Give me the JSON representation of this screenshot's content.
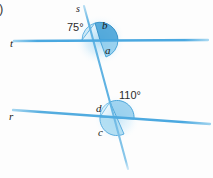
{
  "figure": {
    "kind": "geometry-diagram",
    "background_color": "#fdfdfd",
    "list_marker": ")",
    "line_color": "#4aa8e0",
    "line_color_light": "#8fcdee",
    "arc_fill": "#b9e0f5",
    "arc_fill_strong": "#6cc0ea",
    "arc_stroke": "#3f9fd6",
    "glow_color": "#bfe3f7",
    "label_color": "#1a1a1a"
  },
  "lines": [
    {
      "id": "line-t",
      "label": "t",
      "label_x": 10,
      "label_y": 45,
      "x1": 14,
      "y1": 41,
      "x2": 208,
      "y2": 40
    },
    {
      "id": "line-r",
      "label": "r",
      "label_x": 9,
      "label_y": 118,
      "x1": 13,
      "y1": 110,
      "x2": 210,
      "y2": 124
    },
    {
      "id": "line-s",
      "label": "s",
      "label_x": 76,
      "label_y": 11,
      "x1": 84,
      "y1": 6,
      "x2": 128,
      "y2": 169
    }
  ],
  "angles": [
    {
      "id": "angle-75",
      "label": "75°",
      "label_x": 70,
      "label_y": 30,
      "vertex": "upper",
      "measure": 75
    },
    {
      "id": "angle-b",
      "label": "b",
      "label_x": 103,
      "label_y": 27,
      "vertex": "upper"
    },
    {
      "id": "angle-a",
      "label": "a",
      "label_x": 105,
      "label_y": 51,
      "vertex": "upper"
    },
    {
      "id": "angle-110",
      "label": "110°",
      "label_x": 121,
      "label_y": 97,
      "vertex": "lower",
      "measure": 110
    },
    {
      "id": "angle-d",
      "label": "d",
      "label_x": 97,
      "label_y": 110,
      "vertex": "lower"
    },
    {
      "id": "angle-c",
      "label": "c",
      "label_x": 99,
      "label_y": 133,
      "vertex": "lower"
    }
  ],
  "intersections": [
    {
      "id": "vertex-upper",
      "cx": 100,
      "cy": 40
    },
    {
      "id": "vertex-lower",
      "cx": 117,
      "cy": 118
    }
  ]
}
